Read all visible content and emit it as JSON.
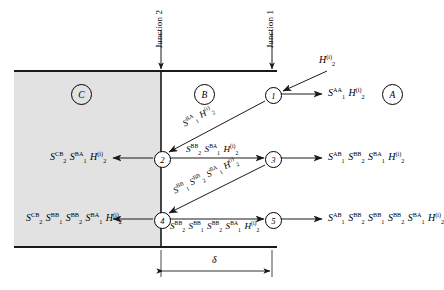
{
  "figure": {
    "type": "scattering-bounce-diagram",
    "regions": [
      {
        "id": "A",
        "label": "A",
        "x": 392,
        "y": 93,
        "shaded": false
      },
      {
        "id": "B",
        "label": "B",
        "x": 203,
        "y": 93,
        "shaded": false
      },
      {
        "id": "C",
        "label": "C",
        "x": 80,
        "y": 93,
        "shaded": true
      }
    ],
    "junctions": [
      {
        "id": "junction-1",
        "label": "Junction 1",
        "x": 272
      },
      {
        "id": "junction-2",
        "label": "Junction 2",
        "x": 161
      }
    ],
    "nodes": [
      {
        "id": 1,
        "label": "1",
        "x": 272,
        "y": 94
      },
      {
        "id": 2,
        "label": "2",
        "x": 161,
        "y": 158
      },
      {
        "id": 3,
        "label": "3",
        "x": 272,
        "y": 158
      },
      {
        "id": 4,
        "label": "4",
        "x": 161,
        "y": 219
      },
      {
        "id": 5,
        "label": "5",
        "x": 272,
        "y": 219
      }
    ],
    "dimension": {
      "label": "δ",
      "from": 161,
      "to": 272
    },
    "incident": {
      "terms": [
        {
          "base": "H",
          "sub": "2",
          "sup": "(i)"
        }
      ]
    },
    "expressions": {
      "node1_out": [
        {
          "base": "S",
          "sub": "1",
          "sup": "AA"
        },
        {
          "base": "H",
          "sub": "2",
          "sup": "(i)"
        }
      ],
      "diag_1_to_2": [
        {
          "base": "S",
          "sub": "1",
          "sup": "BA"
        },
        {
          "base": "H",
          "sub": "2",
          "sup": "(i)"
        }
      ],
      "node2_out_left": [
        {
          "base": "S",
          "sub": "2",
          "sup": "CB"
        },
        {
          "base": "S",
          "sub": "1",
          "sup": "BA"
        },
        {
          "base": "H",
          "sub": "2",
          "sup": "(i)"
        }
      ],
      "node2_to_3": [
        {
          "base": "S",
          "sub": "2",
          "sup": "BB"
        },
        {
          "base": "S",
          "sub": "1",
          "sup": "BA"
        },
        {
          "base": "H",
          "sub": "2",
          "sup": "(i)"
        }
      ],
      "node3_out": [
        {
          "base": "S",
          "sub": "1",
          "sup": "AB"
        },
        {
          "base": "S",
          "sub": "2",
          "sup": "BB"
        },
        {
          "base": "S",
          "sub": "1",
          "sup": "BA"
        },
        {
          "base": "H",
          "sub": "2",
          "sup": "(i)"
        }
      ],
      "diag_3_to_4": [
        {
          "base": "S",
          "sub": "1",
          "sup": "BB"
        },
        {
          "base": "S",
          "sub": "2",
          "sup": "BB"
        },
        {
          "base": "S",
          "sub": "1",
          "sup": "BA"
        },
        {
          "base": "H",
          "sub": "2",
          "sup": "(i)"
        }
      ],
      "node4_out_left": [
        {
          "base": "S",
          "sub": "2",
          "sup": "CB"
        },
        {
          "base": "S",
          "sub": "1",
          "sup": "BB"
        },
        {
          "base": "S",
          "sub": "2",
          "sup": "BB"
        },
        {
          "base": "S",
          "sub": "1",
          "sup": "BA"
        },
        {
          "base": "H",
          "sub": "2",
          "sup": "(i)"
        }
      ],
      "node4_to_5": [
        {
          "base": "S",
          "sub": "2",
          "sup": "BB"
        },
        {
          "base": "S",
          "sub": "1",
          "sup": "BB"
        },
        {
          "base": "S",
          "sub": "2",
          "sup": "BB"
        },
        {
          "base": "S",
          "sub": "1",
          "sup": "BA"
        },
        {
          "base": "H",
          "sub": "2",
          "sup": "(i)"
        }
      ],
      "node5_out": [
        {
          "base": "S",
          "sub": "1",
          "sup": "AB"
        },
        {
          "base": "S",
          "sub": "2",
          "sup": "BB"
        },
        {
          "base": "S",
          "sub": "1",
          "sup": "BB"
        },
        {
          "base": "S",
          "sub": "2",
          "sup": "BB"
        },
        {
          "base": "S",
          "sub": "1",
          "sup": "BA"
        },
        {
          "base": "H",
          "sub": "2",
          "sup": "(i)"
        }
      ]
    },
    "colors": {
      "line": "#1a1a1a",
      "shade": "#e2e2e2",
      "background": "#ffffff"
    }
  }
}
